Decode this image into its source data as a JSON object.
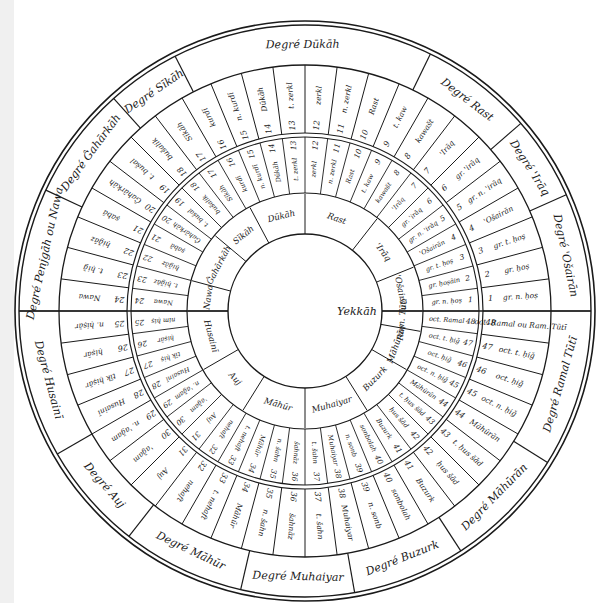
{
  "diagram": {
    "center_label": "Yekkāh",
    "ink_color": "#1a1a1a",
    "background": "#ffffff",
    "degrees": [
      {
        "label": "Degré Dūkāh"
      },
      {
        "label": "Degré Rast"
      },
      {
        "label": "Degré 'Irāq"
      },
      {
        "label": "Degré 'Ošairān"
      },
      {
        "label": "Degré Ramal Tūtī"
      },
      {
        "label": "Degré Māhūrān"
      },
      {
        "label": "Degré Buzurk"
      },
      {
        "label": "Degré Muhaiyar"
      },
      {
        "label": "Degré Māhūr"
      },
      {
        "label": "Degré Auj"
      },
      {
        "label": "Degré Husainī"
      },
      {
        "label": "Degré Penjgāh ou Nawa"
      },
      {
        "label": "Degré Ĝahārkāh"
      },
      {
        "label": "Degré Sīkāh"
      }
    ],
    "outer_ring": [
      {
        "n": "1",
        "name": "gr. n. ḥoṣ"
      },
      {
        "n": "2",
        "name": "gr. ḥoṣ"
      },
      {
        "n": "3",
        "name": "gr. t. ḥoṣ"
      },
      {
        "n": "4",
        "name": "'Ošairān"
      },
      {
        "n": "5",
        "name": "gr. n. 'irāq"
      },
      {
        "n": "6",
        "name": "gr. 'irāq"
      },
      {
        "n": "7",
        "name": "'Irāq"
      },
      {
        "n": "8",
        "name": "kawašt"
      },
      {
        "n": "9",
        "name": "t. kaw"
      },
      {
        "n": "10",
        "name": "Rast"
      },
      {
        "n": "11",
        "name": "n. zerkl"
      },
      {
        "n": "12",
        "name": "zerkl"
      },
      {
        "n": "13",
        "name": "t. zerkl"
      },
      {
        "n": "14",
        "name": "Dūkāh"
      },
      {
        "n": "15",
        "name": "n. kurdī"
      },
      {
        "n": "16",
        "name": "kurdī"
      },
      {
        "n": "17",
        "name": "Sīkāh"
      },
      {
        "n": "18",
        "name": "bušalik"
      },
      {
        "n": "19",
        "name": "t. bušal"
      },
      {
        "n": "20",
        "name": "Ĝahārkāh"
      },
      {
        "n": "21",
        "name": "ṣabā"
      },
      {
        "n": "22",
        "name": "ḥiǧāz"
      },
      {
        "n": "23",
        "name": "t. ḥiǧ"
      },
      {
        "n": "24",
        "name": "Nawa"
      },
      {
        "n": "25",
        "name": "n. ḥiṣār"
      },
      {
        "n": "26",
        "name": "ḥiṣār"
      },
      {
        "n": "27",
        "name": "tīk ḥiṣār"
      },
      {
        "n": "28",
        "name": "Husainī"
      },
      {
        "n": "29",
        "name": "n. 'aǧam"
      },
      {
        "n": "30",
        "name": "'aǧam"
      },
      {
        "n": "31",
        "name": "Auj"
      },
      {
        "n": "32",
        "name": "nehaft"
      },
      {
        "n": "33",
        "name": "t. nehaft"
      },
      {
        "n": "34",
        "name": "Māhūr"
      },
      {
        "n": "35",
        "name": "n. šahn"
      },
      {
        "n": "36",
        "name": "šahnāz"
      },
      {
        "n": "37",
        "name": "t. šahn"
      },
      {
        "n": "38",
        "name": "Muhaiyar"
      },
      {
        "n": "39",
        "name": "n. sonb"
      },
      {
        "n": "40",
        "name": "sonbolah"
      },
      {
        "n": "41",
        "name": "Buzurk"
      },
      {
        "n": "42",
        "name": "ḥus šād"
      },
      {
        "n": "43",
        "name": "t. ḥus šād"
      },
      {
        "n": "44",
        "name": "Māhūrān"
      },
      {
        "n": "45",
        "name": "oct. n. ḥiǧ"
      },
      {
        "n": "46",
        "name": "oct. ḥiǧ"
      },
      {
        "n": "47",
        "name": "oct. t. ḥiǧ"
      },
      {
        "n": "48",
        "name": "oct. Ramal ou Ram. Tūtī"
      }
    ],
    "inner_ring": [
      {
        "n": "1",
        "name": "gr. n. ḥoṣ"
      },
      {
        "n": "2",
        "name": "gr. ḥoṣāin"
      },
      {
        "n": "3",
        "name": "gr. t. ḥoṣ"
      },
      {
        "n": "4",
        "name": "'Ošairān"
      },
      {
        "n": "5",
        "name": "gr. n. 'irāq"
      },
      {
        "n": "6",
        "name": "gr. 'irāq"
      },
      {
        "n": "7",
        "name": "'Irāq"
      },
      {
        "n": "8",
        "name": "kawašt"
      },
      {
        "n": "9",
        "name": "t. kaw"
      },
      {
        "n": "10",
        "name": "Rast"
      },
      {
        "n": "11",
        "name": "n. zerkl"
      },
      {
        "n": "12",
        "name": "zerkl"
      },
      {
        "n": "13",
        "name": "t. zerkl"
      },
      {
        "n": "14",
        "name": "Dūkāh"
      },
      {
        "n": "15",
        "name": "n. kurdī"
      },
      {
        "n": "16",
        "name": "kurdī"
      },
      {
        "n": "17",
        "name": "Sīkāh"
      },
      {
        "n": "18",
        "name": "bušalik"
      },
      {
        "n": "19",
        "name": "t. bušal"
      },
      {
        "n": "20",
        "name": "Ĝahārkāh"
      },
      {
        "n": "21",
        "name": "ṣabā"
      },
      {
        "n": "22",
        "name": "ḥiǧāz"
      },
      {
        "n": "23",
        "name": "t. ḥiǧāz"
      },
      {
        "n": "24",
        "name": "Nawa"
      },
      {
        "n": "25",
        "name": "nim ḥiṣ"
      },
      {
        "n": "26",
        "name": "ḥiṣār"
      },
      {
        "n": "27",
        "name": "tīk ḥiṣ"
      },
      {
        "n": "28",
        "name": "Husainī"
      },
      {
        "n": "29",
        "name": "n. 'aǧam"
      },
      {
        "n": "30",
        "name": "'aǧam"
      },
      {
        "n": "31",
        "name": "Auj"
      },
      {
        "n": "32",
        "name": "nehaft"
      },
      {
        "n": "33",
        "name": "t. nehaft"
      },
      {
        "n": "34",
        "name": "Māhūr"
      },
      {
        "n": "35",
        "name": "n. šahn"
      },
      {
        "n": "36",
        "name": "šahnāz"
      },
      {
        "n": "37",
        "name": "t. šahn"
      },
      {
        "n": "38",
        "name": "Muhaiyar"
      },
      {
        "n": "39",
        "name": "n. sonb"
      },
      {
        "n": "40",
        "name": "sonbolah"
      },
      {
        "n": "41",
        "name": "Buzurk"
      },
      {
        "n": "42",
        "name": "ḥus šād"
      },
      {
        "n": "43",
        "name": "t. ḥus šād"
      },
      {
        "n": "44",
        "name": "Māhūrān"
      },
      {
        "n": "45",
        "name": "oct. n. ḥiǧ"
      },
      {
        "n": "46",
        "name": "oct. ḥiǧ"
      },
      {
        "n": "47",
        "name": "oct. t. ḥiǧ"
      },
      {
        "n": "48",
        "name": "oct. Ramal"
      }
    ],
    "core_ring": [
      {
        "label": "'Ošairān"
      },
      {
        "label": "'Irāq"
      },
      {
        "label": "Rast"
      },
      {
        "label": "Dūkāh"
      },
      {
        "label": "Sīkāh"
      },
      {
        "label": "Ĝahārkāh"
      },
      {
        "label": "Nawa"
      },
      {
        "label": "Husainī"
      },
      {
        "label": "Auj"
      },
      {
        "label": "Māhūr"
      },
      {
        "label": "Muhaiyar"
      },
      {
        "label": "Buzurk"
      },
      {
        "label": "Māhūrān"
      },
      {
        "label": "Ram. Tūtī"
      }
    ]
  }
}
